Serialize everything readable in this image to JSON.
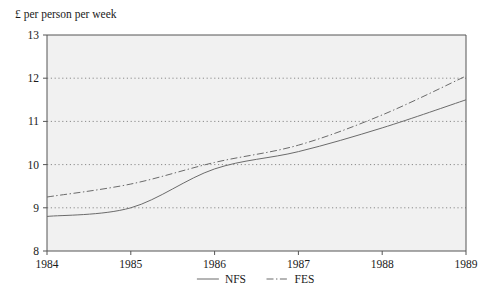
{
  "chart_data": {
    "type": "line",
    "title": "",
    "ylabel": "£ per person per week",
    "xlabel": "",
    "x": [
      1984,
      1985,
      1986,
      1987,
      1988,
      1989
    ],
    "xtick_labels": [
      "1984",
      "1985",
      "1986",
      "1987",
      "1988",
      "1989"
    ],
    "ytick_labels": [
      "8",
      "9",
      "10",
      "11",
      "12",
      "13"
    ],
    "yticks": [
      8,
      9,
      10,
      11,
      12,
      13
    ],
    "xlim": [
      1984,
      1989
    ],
    "ylim": [
      8,
      13
    ],
    "grid": "horizontal-dotted",
    "legend_position": "bottom-center",
    "series": [
      {
        "name": "NFS",
        "style": "solid",
        "color": "#6b6b6b",
        "values": [
          8.8,
          9.0,
          9.9,
          10.3,
          10.85,
          11.5
        ]
      },
      {
        "name": "FES",
        "style": "dash-dot",
        "color": "#6b6b6b",
        "values": [
          9.25,
          9.55,
          10.05,
          10.45,
          11.15,
          12.05
        ]
      }
    ]
  },
  "legend": {
    "items": [
      {
        "label": "NFS",
        "style": "solid"
      },
      {
        "label": "FES",
        "style": "dash-dot"
      }
    ]
  },
  "colors": {
    "plot_background": "#f1f1f1",
    "axis": "#555555",
    "gridline": "#8a8a8a",
    "series_line": "#6b6b6b",
    "text": "#1a1a1a",
    "page_background": "#ffffff"
  },
  "axis_labels": {
    "y_title": "£ per person per week"
  }
}
